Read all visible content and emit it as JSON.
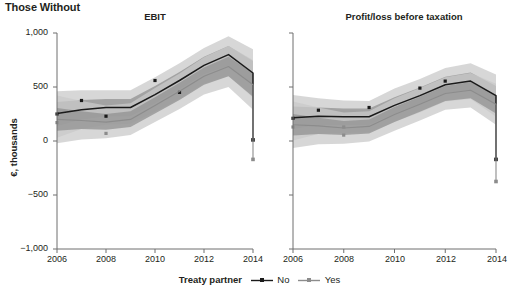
{
  "figure": {
    "title": "Those Without",
    "y_axis_label": "€, thousands",
    "y_ticks": [
      "1,000",
      "500",
      "0",
      "−500",
      "−1,000"
    ],
    "y_tick_values": [
      1000,
      500,
      0,
      -500,
      -1000
    ],
    "x_ticks": [
      "2006",
      "2008",
      "2010",
      "2012",
      "2014"
    ],
    "x_tick_values": [
      2006,
      2008,
      2010,
      2012,
      2014
    ]
  },
  "legend": {
    "title": "Treaty partner",
    "entries": [
      {
        "label": "No",
        "color": "#1a1a1a",
        "marker": "square"
      },
      {
        "label": "Yes",
        "color": "#8c8c8c",
        "marker": "square"
      }
    ]
  },
  "colors": {
    "line_no": "#1a1a1a",
    "line_yes": "#8c8c8c",
    "band_outer": "#c9c9c9",
    "band_inner": "#8f8f8f",
    "axis": "#6e6e6e",
    "text": "#231f20"
  },
  "chart_data": {
    "type": "line",
    "title": "Those Without",
    "xlabel": "",
    "ylabel": "€, thousands",
    "xlim": [
      2006,
      2014
    ],
    "ylim": [
      -1000,
      1000
    ],
    "grid": false,
    "legend_position": "bottom",
    "panels": [
      {
        "title": "EBIT",
        "x": [
          2006,
          2007,
          2008,
          2009,
          2010,
          2011,
          2012,
          2013,
          2014
        ],
        "series": [
          {
            "name": "No",
            "color": "#1a1a1a",
            "values": [
              255,
              290,
              310,
              310,
              430,
              560,
              700,
              800,
              630
            ],
            "ci_inner_low": [
              140,
              200,
              230,
              230,
              350,
              480,
              620,
              700,
              520
            ],
            "ci_inner_high": [
              360,
              380,
              390,
              390,
              510,
              640,
              780,
              880,
              740
            ],
            "ci_outer_low": [
              30,
              110,
              150,
              160,
              270,
              390,
              530,
              600,
              400
            ],
            "ci_outer_high": [
              460,
              470,
              470,
              470,
              590,
              720,
              860,
              970,
              850
            ],
            "markers_x": [
              2006,
              2007,
              2008,
              2010,
              2011
            ],
            "markers_y": [
              250,
              375,
              230,
              560,
              450
            ]
          },
          {
            "name": "Yes",
            "color": "#8c8c8c",
            "values": [
              200,
              190,
              175,
              200,
              330,
              460,
              600,
              690,
              520
            ],
            "ci_inner_low": [
              95,
              110,
              105,
              130,
              255,
              380,
              520,
              600,
              410
            ],
            "ci_inner_high": [
              305,
              275,
              250,
              275,
              405,
              540,
              680,
              780,
              630
            ],
            "ci_outer_low": [
              -20,
              15,
              25,
              55,
              175,
              295,
              430,
              500,
              290
            ],
            "ci_outer_high": [
              420,
              370,
              330,
              350,
              490,
              625,
              775,
              880,
              750
            ],
            "markers_x": [
              2006,
              2008
            ],
            "markers_y": [
              170,
              70
            ]
          }
        ],
        "series_end_2014": {
          "No": 10,
          "Yes": -170
        }
      },
      {
        "title": "Profit/loss before taxation",
        "x": [
          2006,
          2007,
          2008,
          2009,
          2010,
          2011,
          2012,
          2013,
          2014
        ],
        "series": [
          {
            "name": "No",
            "color": "#1a1a1a",
            "values": [
              215,
              230,
              225,
              225,
              330,
              420,
              520,
              555,
              420
            ],
            "ci_inner_low": [
              110,
              150,
              150,
              150,
              255,
              345,
              445,
              475,
              330
            ],
            "ci_inner_high": [
              320,
              310,
              300,
              300,
              405,
              495,
              595,
              635,
              510
            ],
            "ci_outer_low": [
              5,
              65,
              75,
              80,
              175,
              265,
              365,
              390,
              225
            ],
            "ci_outer_high": [
              425,
              395,
              375,
              370,
              485,
              575,
              675,
              720,
              615
            ],
            "markers_x": [
              2006,
              2007,
              2009,
              2011,
              2012
            ],
            "markers_y": [
              210,
              285,
              310,
              490,
              555
            ]
          },
          {
            "name": "Yes",
            "color": "#8c8c8c",
            "values": [
              150,
              140,
              120,
              135,
              245,
              340,
              440,
              470,
              340
            ],
            "ci_inner_low": [
              50,
              65,
              55,
              70,
              175,
              270,
              370,
              395,
              255
            ],
            "ci_inner_high": [
              250,
              215,
              185,
              200,
              315,
              410,
              510,
              545,
              425
            ],
            "ci_outer_low": [
              -65,
              -30,
              -25,
              -5,
              95,
              190,
              290,
              310,
              150
            ],
            "ci_outer_high": [
              365,
              310,
              265,
              275,
              395,
              490,
              590,
              630,
              530
            ],
            "markers_x": [
              2006,
              2008,
              2008
            ],
            "markers_y": [
              130,
              130,
              55
            ]
          }
        ],
        "series_end_2014": {
          "No": -170,
          "Yes": -375
        }
      }
    ]
  }
}
